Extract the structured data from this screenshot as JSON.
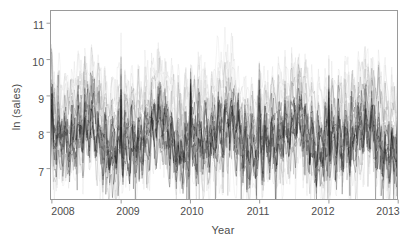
{
  "chart_data": {
    "type": "line",
    "title": "",
    "subtitle": "",
    "xlabel": "Year",
    "ylabel": "ln (sales)",
    "xlim": [
      2007.98,
      2012.99
    ],
    "ylim": [
      6.15,
      11.35
    ],
    "grid": false,
    "legend": null,
    "annotations": [],
    "xticks": [
      2008,
      2009,
      2010,
      2011,
      2012,
      2013
    ],
    "xtick_labels": [
      "2008",
      "2009",
      "2010",
      "2011",
      "2012",
      "2013"
    ],
    "yticks": [
      7,
      8,
      9,
      10,
      11
    ],
    "ytick_labels": [
      "7",
      "8",
      "9",
      "10",
      "11"
    ],
    "series_count": 24,
    "points_per_series": 365,
    "series_style": {
      "core_color": "#1a1a1a",
      "mid_color": "#6b6b6b",
      "light_color": "#b4b4b4",
      "linewidth": 0.35,
      "opacity": 0.55
    },
    "series": [
      {
        "name": "store-01",
        "band": "light",
        "level": 9.25,
        "noise": 0.42,
        "spike": 1.15
      },
      {
        "name": "store-02",
        "band": "light",
        "level": 9.1,
        "noise": 0.4,
        "spike": 1.05
      },
      {
        "name": "store-03",
        "band": "light",
        "level": 8.98,
        "noise": 0.44,
        "spike": 1.25
      },
      {
        "name": "store-04",
        "band": "light",
        "level": 9.35,
        "noise": 0.38,
        "spike": 0.95
      },
      {
        "name": "store-05",
        "band": "light",
        "level": 8.85,
        "noise": 0.46,
        "spike": 1.35
      },
      {
        "name": "store-06",
        "band": "mid",
        "level": 8.7,
        "noise": 0.4,
        "spike": 1.1
      },
      {
        "name": "store-07",
        "band": "mid",
        "level": 8.58,
        "noise": 0.42,
        "spike": 1.2
      },
      {
        "name": "store-08",
        "band": "mid",
        "level": 8.45,
        "noise": 0.45,
        "spike": 1.3
      },
      {
        "name": "store-09",
        "band": "mid",
        "level": 8.32,
        "noise": 0.41,
        "spike": 1.15
      },
      {
        "name": "store-10",
        "band": "mid",
        "level": 8.22,
        "noise": 0.44,
        "spike": 1.4
      },
      {
        "name": "store-11",
        "band": "core",
        "level": 8.15,
        "noise": 0.38,
        "spike": 1.1
      },
      {
        "name": "store-12",
        "band": "core",
        "level": 8.05,
        "noise": 0.4,
        "spike": 1.25
      },
      {
        "name": "store-13",
        "band": "core",
        "level": 7.98,
        "noise": 0.42,
        "spike": 1.35
      },
      {
        "name": "store-14",
        "band": "core",
        "level": 7.9,
        "noise": 0.39,
        "spike": 1.15
      },
      {
        "name": "store-15",
        "band": "core",
        "level": 7.82,
        "noise": 0.43,
        "spike": 1.45
      },
      {
        "name": "store-16",
        "band": "core",
        "level": 7.74,
        "noise": 0.4,
        "spike": 1.2
      },
      {
        "name": "store-17",
        "band": "core",
        "level": 7.66,
        "noise": 0.42,
        "spike": 1.3
      },
      {
        "name": "store-18",
        "band": "core",
        "level": 7.58,
        "noise": 0.44,
        "spike": 1.5
      },
      {
        "name": "store-19",
        "band": "core",
        "level": 7.5,
        "noise": 0.41,
        "spike": 1.25
      },
      {
        "name": "store-20",
        "band": "mid",
        "level": 7.42,
        "noise": 0.46,
        "spike": 1.4
      },
      {
        "name": "store-21",
        "band": "mid",
        "level": 7.34,
        "noise": 0.44,
        "spike": 1.2
      },
      {
        "name": "store-22",
        "band": "light",
        "level": 7.26,
        "noise": 0.48,
        "spike": 1.35
      },
      {
        "name": "store-23",
        "band": "light",
        "level": 7.18,
        "noise": 0.5,
        "spike": 1.45
      },
      {
        "name": "store-24",
        "band": "light",
        "level": 7.05,
        "noise": 0.52,
        "spike": 1.55
      }
    ]
  },
  "axes": {
    "ylabel": "ln (sales)",
    "xlabel": "Year",
    "ytick_labels": [
      "11",
      "10",
      "9",
      "8",
      "7"
    ],
    "xtick_labels": [
      "2008",
      "2009",
      "2010",
      "2011",
      "2012",
      "2013"
    ]
  },
  "colors": {
    "frame": "#9a9a9a",
    "tick": "#9a9a9a",
    "text": "#4d4d4d",
    "background": "#ffffff",
    "data_dark": "#1a1a1a",
    "data_mid": "#6b6b6b",
    "data_light": "#b4b4b4"
  }
}
